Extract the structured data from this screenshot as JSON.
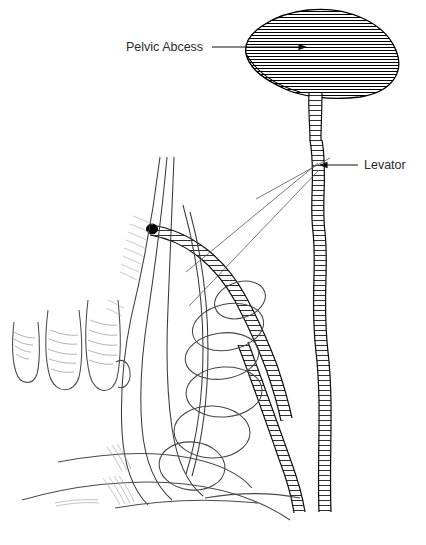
{
  "figure": {
    "background_color": "#ffffff",
    "ink_color": "#000000",
    "light_ink_color": "#555555",
    "text_color": "#2b2b2b"
  },
  "labels": [
    {
      "id": "pelvic-abcess",
      "text": "Pelvic Abcess",
      "text_x": 126,
      "text_y": 47,
      "leader_from_x": 212,
      "leader_from_y": 47,
      "leader_to_x": 308,
      "leader_to_y": 47,
      "arrow_direction": "right"
    },
    {
      "id": "levator",
      "text": "Levator",
      "text_x": 364,
      "text_y": 165,
      "leader_from_x": 358,
      "leader_from_y": 165,
      "leader_to_x": 318,
      "leader_to_y": 165,
      "arrow_direction": "left"
    }
  ],
  "structures": [
    {
      "id": "abscess-cavity",
      "name": "pelvic-abscess-cavity",
      "fill_pattern": "horizontal-hatch",
      "hatch_spacing_px": 3
    },
    {
      "id": "abscess-neck",
      "name": "abscess-neck-tract",
      "fill_pattern": "ladder-hatch"
    },
    {
      "id": "levator-tract-vertical",
      "name": "levator-muscle-band",
      "fill_pattern": "ladder-hatch"
    },
    {
      "id": "fistula-tract-curved",
      "name": "fistula-tract",
      "fill_pattern": "ladder-hatch",
      "has_internal_opening_dot": true
    },
    {
      "id": "anal-canal",
      "name": "anal-canal"
    },
    {
      "id": "rectal-contents",
      "name": "rectal-contents-ovals",
      "count": 6
    },
    {
      "id": "examining-hand",
      "name": "examining-fingers",
      "count": 3
    },
    {
      "id": "perineum-lines",
      "name": "perineal-floor-contours"
    }
  ]
}
